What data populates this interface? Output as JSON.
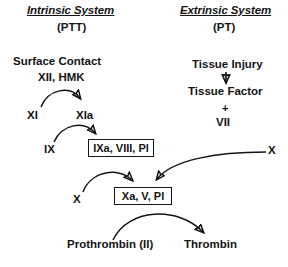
{
  "diagram": {
    "background_color": "#ffffff",
    "stroke_color": "#141414",
    "width": 288,
    "height": 267,
    "headers": {
      "left_title": "Intrinsic System",
      "left_sub": "(PTT)",
      "right_title": "Extrinsic System",
      "right_sub": "(PT)"
    },
    "nodes": {
      "surface_contact": "Surface Contact",
      "xii_hmk": "XII, HMK",
      "xi": "XI",
      "xia": "XIa",
      "ix": "IX",
      "ixa_complex": "IXa, VIII, Pl",
      "x_left": "X",
      "xa_complex": "Xa, V, Pl",
      "prothrombin": "Prothrombin (II)",
      "thrombin": "Thrombin",
      "tissue_injury": "Tissue Injury",
      "tissue_factor": "Tissue Factor",
      "plus": "+",
      "vii": "VII",
      "x_right": "X"
    },
    "edges": [
      {
        "from": "XI",
        "to": "XIa",
        "style": "curved-arrow"
      },
      {
        "from": "IX",
        "to": "IXa, VIII, Pl",
        "style": "curved-arrow"
      },
      {
        "from": "Tissue Injury",
        "to": "Tissue Factor",
        "style": "straight-arrow"
      },
      {
        "from": "X",
        "to": "Xa, V, Pl",
        "style": "curved-arrow"
      },
      {
        "from": "IXa, VIII, Pl",
        "to": "Xa, V, Pl",
        "style": "curved-arrow"
      },
      {
        "from": "X (extrinsic)",
        "to": "Xa, V, Pl",
        "style": "curved-arrow"
      },
      {
        "from": "Prothrombin (II)",
        "to": "Thrombin",
        "style": "curved-arrow"
      }
    ]
  }
}
